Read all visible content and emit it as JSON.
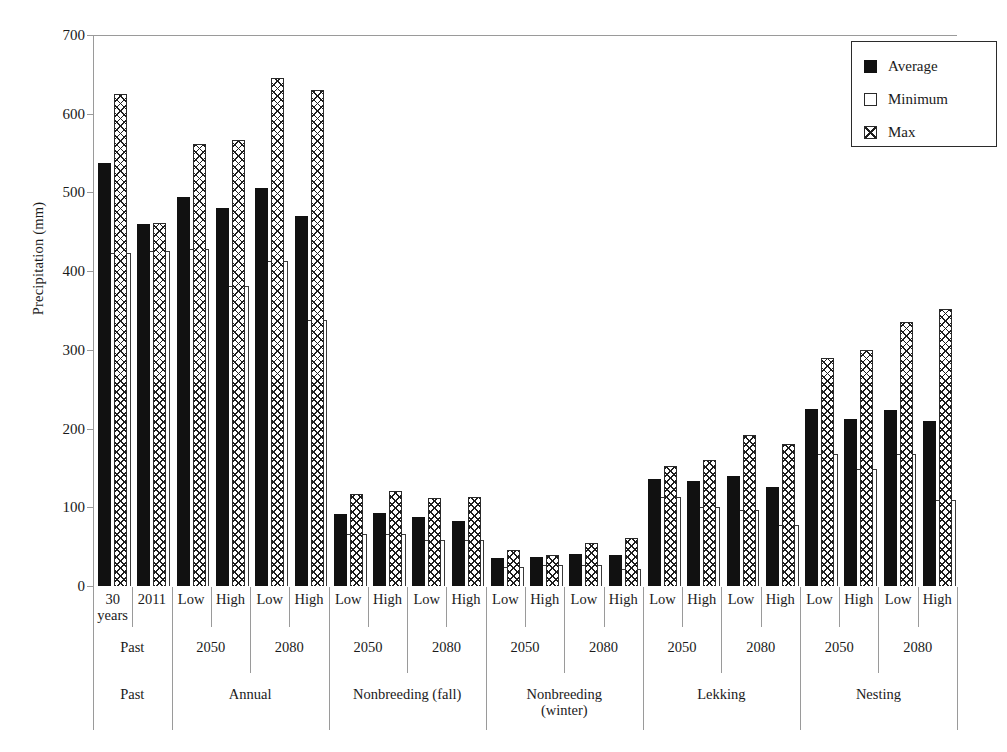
{
  "chart_data": {
    "type": "bar",
    "title": "",
    "xlabel": "",
    "ylabel": "Precipitation (mm)",
    "ylim": [
      0,
      700
    ],
    "yticks": [
      0,
      100,
      200,
      300,
      400,
      500,
      600,
      700
    ],
    "grid": false,
    "legend_position": "top-right",
    "legend": [
      "Average",
      "Minimum",
      "Max"
    ],
    "series": [
      {
        "name": "Average",
        "style": "solid-black",
        "values": [
          538,
          460,
          494,
          480,
          506,
          470,
          91,
          93,
          88,
          82,
          35,
          37,
          41,
          40,
          136,
          133,
          140,
          126,
          225,
          212,
          224,
          210
        ]
      },
      {
        "name": "Minimum",
        "style": "white-open",
        "values": [
          423,
          425,
          428,
          381,
          413,
          338,
          66,
          66,
          58,
          59,
          24,
          27,
          27,
          22,
          113,
          100,
          97,
          78,
          168,
          149,
          168,
          109
        ]
      },
      {
        "name": "Max",
        "style": "crosshatch",
        "values": [
          625,
          461,
          561,
          567,
          646,
          630,
          117,
          121,
          112,
          113,
          46,
          39,
          55,
          61,
          152,
          160,
          192,
          180,
          290,
          300,
          336,
          352
        ]
      }
    ],
    "categories": [
      {
        "group": "Past",
        "period": "Past",
        "scenario": "30 years"
      },
      {
        "group": "Past",
        "period": "Past",
        "scenario": "2011"
      },
      {
        "group": "Annual",
        "period": "2050",
        "scenario": "Low"
      },
      {
        "group": "Annual",
        "period": "2050",
        "scenario": "High"
      },
      {
        "group": "Annual",
        "period": "2080",
        "scenario": "Low"
      },
      {
        "group": "Annual",
        "period": "2080",
        "scenario": "High"
      },
      {
        "group": "Nonbreeding (fall)",
        "period": "2050",
        "scenario": "Low"
      },
      {
        "group": "Nonbreeding (fall)",
        "period": "2050",
        "scenario": "High"
      },
      {
        "group": "Nonbreeding (fall)",
        "period": "2080",
        "scenario": "Low"
      },
      {
        "group": "Nonbreeding (fall)",
        "period": "2080",
        "scenario": "High"
      },
      {
        "group": "Nonbreeding (winter)",
        "period": "2050",
        "scenario": "Low"
      },
      {
        "group": "Nonbreeding (winter)",
        "period": "2050",
        "scenario": "High"
      },
      {
        "group": "Nonbreeding (winter)",
        "period": "2080",
        "scenario": "Low"
      },
      {
        "group": "Nonbreeding (winter)",
        "period": "2080",
        "scenario": "High"
      },
      {
        "group": "Lekking",
        "period": "2050",
        "scenario": "Low"
      },
      {
        "group": "Lekking",
        "period": "2050",
        "scenario": "High"
      },
      {
        "group": "Lekking",
        "period": "2080",
        "scenario": "Low"
      },
      {
        "group": "Lekking",
        "period": "2080",
        "scenario": "High"
      },
      {
        "group": "Nesting",
        "period": "2050",
        "scenario": "Low"
      },
      {
        "group": "Nesting",
        "period": "2050",
        "scenario": "High"
      },
      {
        "group": "Nesting",
        "period": "2080",
        "scenario": "Low"
      },
      {
        "group": "Nesting",
        "period": "2080",
        "scenario": "High"
      }
    ],
    "tier_periods": [
      {
        "label": "Past",
        "start": 0,
        "span": 2
      },
      {
        "label": "2050",
        "start": 2,
        "span": 2
      },
      {
        "label": "2080",
        "start": 4,
        "span": 2
      },
      {
        "label": "2050",
        "start": 6,
        "span": 2
      },
      {
        "label": "2080",
        "start": 8,
        "span": 2
      },
      {
        "label": "2050",
        "start": 10,
        "span": 2
      },
      {
        "label": "2080",
        "start": 12,
        "span": 2
      },
      {
        "label": "2050",
        "start": 14,
        "span": 2
      },
      {
        "label": "2080",
        "start": 16,
        "span": 2
      },
      {
        "label": "2050",
        "start": 18,
        "span": 2
      },
      {
        "label": "2080",
        "start": 20,
        "span": 2
      }
    ],
    "tier_groups": [
      {
        "label": "Past",
        "start": 0,
        "span": 2
      },
      {
        "label": "Annual",
        "start": 2,
        "span": 4
      },
      {
        "label": "Nonbreeding (fall)",
        "start": 6,
        "span": 4
      },
      {
        "label": "Nonbreeding\n(winter)",
        "start": 10,
        "span": 4
      },
      {
        "label": "Lekking",
        "start": 14,
        "span": 4
      },
      {
        "label": "Nesting",
        "start": 18,
        "span": 4
      }
    ],
    "colors": {
      "average": "#111111",
      "minimum": "#ffffff",
      "max": "#ffffff",
      "hatch": "#1d1d1d",
      "axis": "#9a9a9a",
      "text": "#1a1a1a"
    }
  }
}
